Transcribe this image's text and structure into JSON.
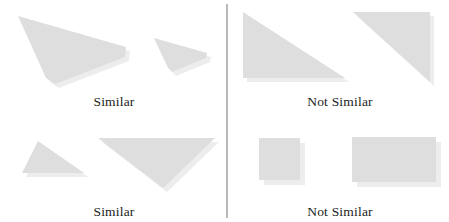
{
  "figure": {
    "width": 449,
    "height": 222,
    "background": "#ffffff",
    "shape_fill": "#dededf",
    "shape_shadow_fill": "#ededee",
    "divider_color": "#b9b9bc",
    "caption_color": "#1b1b1b"
  },
  "divider": {
    "orientation": "vertical",
    "x": 226,
    "y_top": 4,
    "y_bottom": 218,
    "thickness": 2
  },
  "quadrants": [
    {
      "id": "top-left",
      "caption": "Similar",
      "caption_x": 114,
      "caption_y": 95,
      "verdict": "similar",
      "shapes": [
        {
          "name": "large-quadrilateral",
          "kind": "quadrilateral",
          "points": "18,16 126,47 125,57 55,84 46,78",
          "shadow_offset": [
            4,
            4
          ]
        },
        {
          "name": "small-quadrilateral",
          "kind": "quadrilateral",
          "points": "154,38 207,53 206,58 172,72 168,68",
          "shadow_offset": [
            4,
            4
          ]
        }
      ]
    },
    {
      "id": "top-right",
      "caption": "Not Similar",
      "caption_x": 340,
      "caption_y": 95,
      "verdict": "not-similar",
      "shapes": [
        {
          "name": "right-triangle-corner-bottom-left",
          "kind": "right-triangle",
          "points": "243,12 243,78 345,78",
          "shadow_offset": [
            4,
            4
          ]
        },
        {
          "name": "right-triangle-corner-top-right",
          "kind": "right-triangle",
          "points": "353,12 430,12 430,82",
          "shadow_offset": [
            4,
            4
          ]
        }
      ]
    },
    {
      "id": "bottom-left",
      "caption": "Similar",
      "caption_x": 114,
      "caption_y": 205,
      "verdict": "similar",
      "shapes": [
        {
          "name": "small-triangle",
          "kind": "triangle",
          "points": "38,141 84,173 22,173",
          "shadow_offset": [
            4,
            4
          ]
        },
        {
          "name": "large-triangle",
          "kind": "triangle",
          "points": "98,138 215,138 163,188",
          "shadow_offset": [
            4,
            4
          ]
        }
      ]
    },
    {
      "id": "bottom-right",
      "caption": "Not Similar",
      "caption_x": 340,
      "caption_y": 205,
      "verdict": "not-similar",
      "shapes": [
        {
          "name": "square",
          "kind": "rectangle",
          "points": "259,138 300,138 300,180 259,180",
          "shadow_offset": [
            5,
            5
          ]
        },
        {
          "name": "wide-rectangle",
          "kind": "rectangle",
          "points": "352,137 436,137 436,182 352,182",
          "shadow_offset": [
            5,
            5
          ]
        }
      ]
    }
  ]
}
